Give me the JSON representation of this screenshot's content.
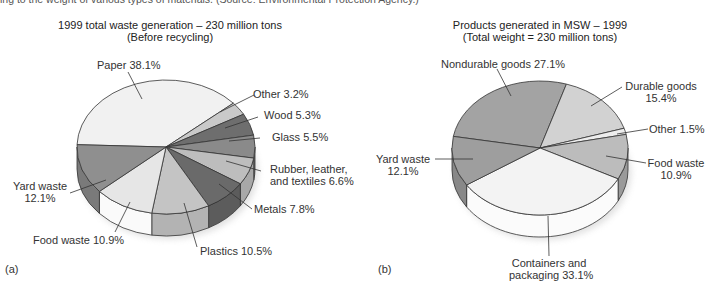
{
  "caption_fragment": "ing to the weight of various types of materials. (Source: Environmental Protection Agency.)",
  "chart_data": [
    {
      "type": "pie",
      "panel": "(a)",
      "title": "1999 total waste generation – 230 million tons",
      "subtitle": "(Before recycling)",
      "style": "3d-exploded-none",
      "categories": [
        "Paper",
        "Other",
        "Wood",
        "Glass",
        "Rubber, leather, and textiles",
        "Metals",
        "Plastics",
        "Food waste",
        "Yard waste"
      ],
      "values": [
        38.1,
        3.2,
        5.3,
        5.5,
        6.6,
        7.8,
        10.5,
        10.9,
        12.1
      ],
      "labels": [
        "Paper 38.1%",
        "Other 3.2%",
        "Wood 5.3%",
        "Glass 5.5%",
        "Rubber, leather,",
        "and textiles 6.6%",
        "Metals 7.8%",
        "Plastics 10.5%",
        "Food waste 10.9%",
        "Yard waste",
        "12.1%"
      ],
      "unit": "%"
    },
    {
      "type": "pie",
      "panel": "(b)",
      "title": "Products generated in MSW – 1999",
      "subtitle": "(Total weight = 230 million tons)",
      "style": "3d",
      "categories": [
        "Nondurable goods",
        "Durable goods",
        "Other",
        "Food waste",
        "Containers and packaging",
        "Yard waste"
      ],
      "values": [
        27.1,
        15.4,
        1.5,
        10.9,
        33.1,
        12.1
      ],
      "labels": [
        "Nondurable goods 27.1%",
        "Durable goods",
        "15.4%",
        "Other 1.5%",
        "Food waste",
        "10.9%",
        "Containers and",
        "packaging 33.1%",
        "Yard waste",
        "12.1%"
      ],
      "unit": "%"
    }
  ],
  "render": {
    "pies": [
      {
        "cx": 166,
        "cy": 147,
        "rx": 89,
        "ry": 67,
        "depth": 22,
        "start_deg": 182,
        "colors": [
          "#f1f1f1",
          "#c9c9c9",
          "#6e6e6e",
          "#8a8a8a",
          "#bdbdbd",
          "#6a6a6a",
          "#c4c4c4",
          "#e6e6e6",
          "#8f8f8f"
        ],
        "side_colors": [
          "#dcdcdc",
          "#b0b0b0",
          "#5a5a5a",
          "#777777",
          "#a8a8a8",
          "#5c5c5c",
          "#b3b3b3",
          "#fafafa",
          "#7a7a7a"
        ],
        "leaders": [
          [
            [
              142,
              99
            ],
            [
              128,
              72
            ]
          ],
          [
            [
              220,
              112
            ],
            [
              254,
              95
            ]
          ],
          [
            [
              225,
              128
            ],
            [
              258,
              117
            ]
          ],
          [
            [
              229,
              141
            ],
            [
              260,
              138
            ]
          ],
          [
            [
              226,
              161
            ],
            [
              261,
              171
            ]
          ],
          [
            [
              219,
              184
            ],
            [
              252,
              209
            ]
          ],
          [
            [
              184,
              203
            ],
            [
              197,
              247
            ]
          ],
          [
            [
              130,
              202
            ],
            [
              115,
              232
            ]
          ],
          [
            [
              106,
              180
            ],
            [
              70,
              193
            ]
          ]
        ]
      },
      {
        "cx": 540,
        "cy": 148,
        "rx": 88,
        "ry": 67,
        "depth": 22,
        "start_deg": 190,
        "colors": [
          "#a3a3a3",
          "#d2d2d2",
          "#ededed",
          "#bcbcbc",
          "#f3f3f3",
          "#9e9e9e"
        ],
        "side_colors": [
          "#888888",
          "#a6a6a6",
          "#d8d8d8",
          "#9a9a9a",
          "#fbfbfb",
          "#888888"
        ],
        "leaders": [
          [
            [
              511,
              96
            ],
            [
              497,
              69
            ]
          ],
          [
            [
              591,
              106
            ],
            [
              622,
              87
            ]
          ],
          [
            [
              617,
              134
            ],
            [
              648,
              129
            ]
          ],
          [
            [
              606,
              156
            ],
            [
              646,
              163
            ]
          ],
          [
            [
              548,
              216
            ],
            [
              549,
              256
            ]
          ],
          [
            [
              473,
              159
            ],
            [
              435,
              159
            ]
          ]
        ]
      }
    ]
  },
  "text": {
    "left_title_1": "1999 total waste generation – 230 million tons",
    "left_title_2": "(Before recycling)",
    "right_title_1": "Products generated in MSW – 1999",
    "right_title_2": "(Total weight = 230 million tons)",
    "a": {
      "paper": "Paper 38.1%",
      "other": "Other 3.2%",
      "wood": "Wood 5.3%",
      "glass": "Glass 5.5%",
      "rubber_1": "Rubber, leather,",
      "rubber_2": "and textiles 6.6%",
      "metals": "Metals 7.8%",
      "plastics": "Plastics 10.5%",
      "food": "Food waste 10.9%",
      "yard_1": "Yard waste",
      "yard_2": "12.1%"
    },
    "b": {
      "nondurable": "Nondurable goods 27.1%",
      "durable_1": "Durable goods",
      "durable_2": "15.4%",
      "other": "Other 1.5%",
      "food_1": "Food waste",
      "food_2": "10.9%",
      "containers_1": "Containers and",
      "containers_2": "packaging 33.1%",
      "yard_1": "Yard waste",
      "yard_2": "12.1%"
    },
    "panel_a": "(a)",
    "panel_b": "(b)"
  }
}
